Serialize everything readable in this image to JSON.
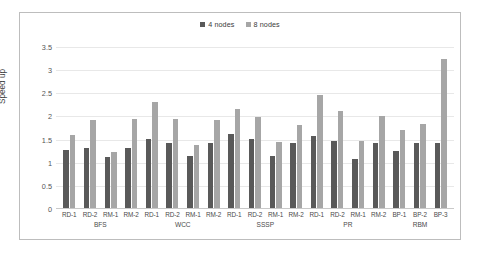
{
  "chart_data": {
    "type": "bar",
    "title": "",
    "xlabel": "",
    "ylabel": "Speed up",
    "ylim": [
      0,
      3.5
    ],
    "ytick_labels": [
      "3.5",
      "3",
      "2.5",
      "2",
      "1.5",
      "1",
      "0.5",
      "0"
    ],
    "ytick_values": [
      3.5,
      3,
      2.5,
      2,
      1.5,
      1,
      0.5,
      0
    ],
    "grid": true,
    "legend_position": "top-center",
    "categories": [
      "RD-1",
      "RD-2",
      "RM-1",
      "RM-2",
      "RD-1",
      "RD-2",
      "RM-1",
      "RM-2",
      "RD-1",
      "RD-2",
      "RM-1",
      "RM-2",
      "RD-1",
      "RD-2",
      "RM-1",
      "RM-2",
      "BP-1",
      "BP-2",
      "BP-3"
    ],
    "groups": [
      {
        "name": "BFS",
        "members": [
          "RD-1",
          "RD-2",
          "RM-1",
          "RM-2"
        ]
      },
      {
        "name": "WCC",
        "members": [
          "RD-1",
          "RD-2",
          "RM-1",
          "RM-2"
        ]
      },
      {
        "name": "SSSP",
        "members": [
          "RD-1",
          "RD-2",
          "RM-1",
          "RM-2"
        ]
      },
      {
        "name": "PR",
        "members": [
          "RD-1",
          "RD-2",
          "RM-1",
          "RM-2"
        ]
      },
      {
        "name": "RBM",
        "members": [
          "BP-1",
          "BP-2",
          "BP-3"
        ]
      }
    ],
    "series": [
      {
        "name": "4 nodes",
        "color": "#595959",
        "values": [
          1.25,
          1.3,
          1.1,
          1.3,
          1.5,
          1.4,
          1.12,
          1.4,
          1.59,
          1.5,
          1.12,
          1.4,
          1.55,
          1.45,
          1.05,
          1.4,
          1.23,
          1.4,
          1.4
        ]
      },
      {
        "name": "8 nodes",
        "color": "#a6a6a6",
        "values": [
          1.58,
          1.9,
          1.2,
          1.92,
          2.29,
          1.93,
          1.36,
          1.9,
          2.15,
          1.96,
          1.42,
          1.79,
          2.45,
          2.09,
          1.44,
          1.98,
          1.68,
          1.81,
          3.23
        ]
      }
    ]
  },
  "legend": {
    "items": [
      {
        "label": "4 nodes",
        "color": "#595959"
      },
      {
        "label": "8 nodes",
        "color": "#a6a6a6"
      }
    ]
  },
  "axis": {
    "y_title": "Speed up"
  }
}
